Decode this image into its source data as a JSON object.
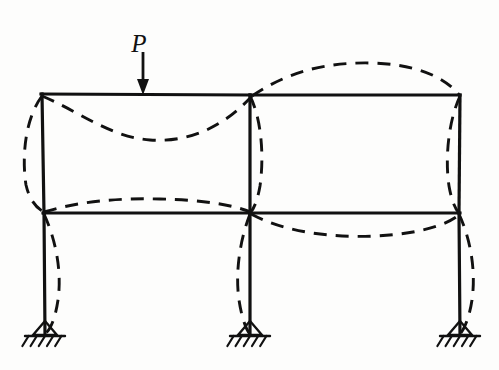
{
  "figure": {
    "background_color": "#fdfdfc",
    "line_color": "#111111"
  },
  "load": {
    "label": "P",
    "label_x": 139,
    "label_y": 42,
    "arrow_x": 143,
    "arrow_top_y": 52,
    "arrow_bottom_y": 95,
    "direction": "down",
    "applied_at": "top-left-bay-beam"
  },
  "geometry": {
    "columns_x": [
      43,
      250,
      460
    ],
    "roof_y": 95,
    "floor_y": 213,
    "base_y": 335,
    "bays": [
      "left-bay",
      "right-bay"
    ],
    "stories": [
      "upper-story",
      "lower-story"
    ]
  },
  "members": {
    "roof_beam_left": "M41,94 L250,95",
    "roof_beam_right": "M250,95 L460,95",
    "floor_beam_left": "M43,213 L250,213",
    "floor_beam_right": "M250,213 L460,213",
    "column_left_upper": "M42,94 L44,213",
    "column_left_lower": "M44,213 L45,334",
    "column_mid_upper": "M250,95 L250,213",
    "column_mid_lower": "M250,213 L250,334",
    "column_right_upper": "M460,95 L459,213",
    "column_right_lower": "M459,213 L460,334"
  },
  "deflected_shape": {
    "description": "Dashed curve showing elastic deformation under load P",
    "roof_left_bay": {
      "shape": "sagging",
      "path": "M42,96 C80,112 110,137 150,140 C195,143 228,122 252,96"
    },
    "roof_right_bay": {
      "shape": "arching-up",
      "path": "M252,96 C290,70 330,62 372,63 C412,64 444,75 460,96"
    },
    "floor_left_bay": {
      "shape": "hogging-up",
      "path": "M44,212 C80,201 120,198 160,199 C205,200 232,205 251,212"
    },
    "floor_right_bay": {
      "shape": "sagging",
      "path": "M251,214 C285,232 330,238 376,236 C418,234 448,225 460,214"
    },
    "column_left_upper": {
      "shape": "bowed-outward-left",
      "path": "M42,96 C24,120 22,160 26,185 C30,202 38,209 44,212"
    },
    "column_left_lower": {
      "shape": "s-curve-right",
      "path": "M44,214 C56,240 62,272 58,300 C55,320 50,330 45,334"
    },
    "column_mid_upper": {
      "shape": "bowed-right-returning",
      "path": "M250,96 C262,120 264,158 260,186 C257,203 253,210 250,213"
    },
    "column_mid_lower": {
      "shape": "bowed-left",
      "path": "M250,214 C240,240 235,272 239,300 C242,320 247,331 250,334"
    },
    "column_right_upper": {
      "shape": "bowed-inward-left",
      "path": "M460,96 C448,122 445,160 449,186 C452,203 456,210 459,213"
    },
    "column_right_lower": {
      "shape": "bowed-outward-right",
      "path": "M459,214 C471,240 476,272 472,300 C469,320 463,331 460,334"
    }
  },
  "supports": [
    {
      "name": "support-left",
      "type": "pinned",
      "x": 45,
      "y": 335
    },
    {
      "name": "support-mid",
      "type": "pinned",
      "x": 250,
      "y": 335
    },
    {
      "name": "support-right",
      "type": "pinned",
      "x": 460,
      "y": 335
    }
  ],
  "support_style": {
    "triangle_half_width": 12,
    "triangle_height": 14,
    "ground_half_width": 20,
    "hatch_count": 5,
    "hatch_length": 10
  }
}
